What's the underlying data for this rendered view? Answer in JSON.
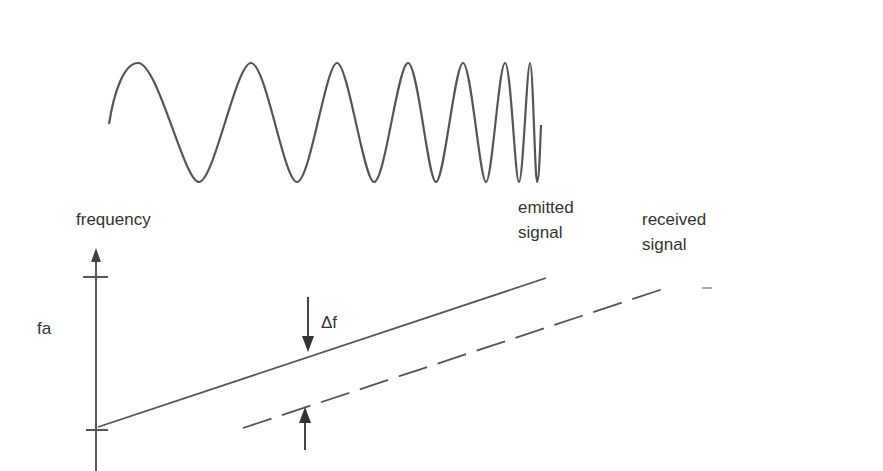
{
  "diagram": {
    "title": "",
    "colors": {
      "line": "#555555",
      "text": "#333333",
      "background": "#ffffff"
    },
    "waveform": {
      "description": "chirp signal with increasing frequency",
      "points": "M109,124 C114,92 124,63 138,63 C158,63 184,182 199,182 C214,182 236,63 251,63 C266,63 284,182 297,182 C310,182 326,63 337,63 C348,63 364,182 374,182 C385,182 398,63 408,63 C418,63 428,182 436,182 C444,182 455,63 463,63 C471,63 480,182 486,182 C492,182 499,63 505,63 C511,63 515,182 519,182 C523,182 527,63 530,63 C533,63 535,182 537,182 C539,182 540,150 541,125"
    },
    "axis": {
      "y_label": "frequency",
      "tick_label": "fa"
    },
    "lines": {
      "emitted": {
        "label_line1": "emitted",
        "label_line2": "signal",
        "style": "solid"
      },
      "received": {
        "label_line1": "received",
        "label_line2": "signal",
        "style": "dashed"
      }
    },
    "annotation": {
      "delta_label": "Δf"
    }
  }
}
